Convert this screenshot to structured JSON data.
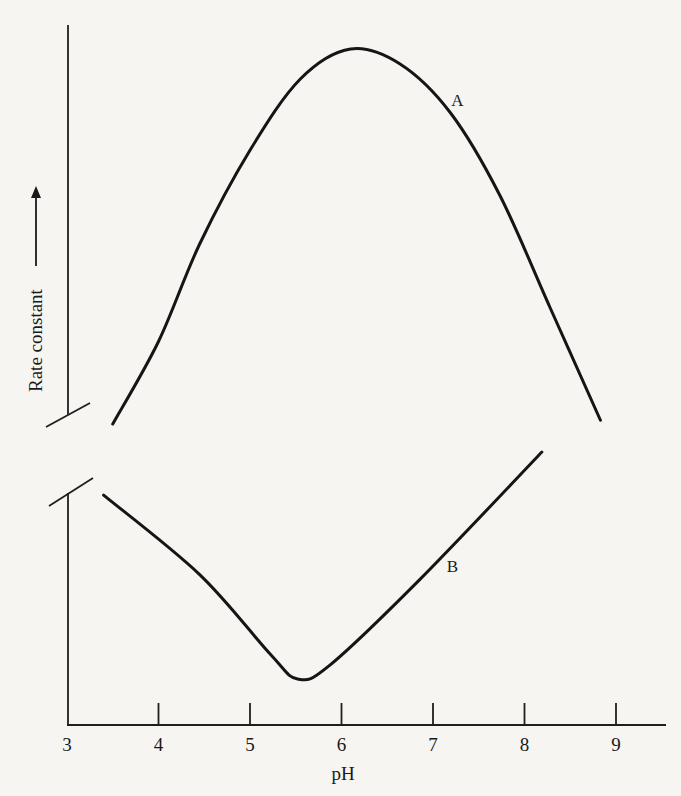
{
  "chart_data": {
    "type": "line",
    "title": "",
    "xlabel": "pH",
    "ylabel": "Rate constant",
    "ylabel_arrow": "up",
    "xlim": [
      3,
      9.5
    ],
    "xticks": [
      3,
      4,
      5,
      6,
      7,
      8,
      9
    ],
    "xtick_labels": [
      "3",
      "4",
      "5",
      "6",
      "7",
      "8",
      "9"
    ],
    "y_axis_break": true,
    "grid": false,
    "legend": "none (curves labeled inline)",
    "series": [
      {
        "name": "A",
        "panel": "upper",
        "note": "relative rate constant, bell-shaped with maximum near pH 6.1",
        "x": [
          3.5,
          4.0,
          4.45,
          5.0,
          5.55,
          6.1,
          6.64,
          7.19,
          7.73,
          8.28,
          8.83
        ],
        "y": [
          0.0,
          0.22,
          0.48,
          0.73,
          0.92,
          1.0,
          0.96,
          0.83,
          0.61,
          0.31,
          0.01
        ],
        "label_x": 7.2
      },
      {
        "name": "B",
        "panel": "lower",
        "note": "relative rate constant, V-shaped with minimum near pH 5.5",
        "x": [
          3.4,
          4.45,
          5.22,
          5.52,
          5.87,
          6.86,
          8.19
        ],
        "y": [
          0.81,
          0.46,
          0.11,
          0.0,
          0.06,
          0.44,
          1.0
        ],
        "label_x": 7.15
      }
    ]
  }
}
